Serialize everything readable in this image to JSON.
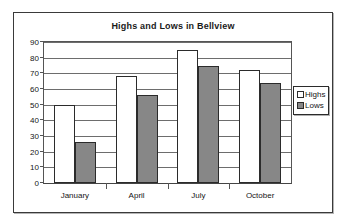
{
  "chart_data": {
    "type": "bar",
    "title": "Highs and Lows in Bellview",
    "xlabel": "",
    "ylabel": "",
    "categories": [
      "January",
      "April",
      "July",
      "October"
    ],
    "series": [
      {
        "name": "Highs",
        "values": [
          50,
          68,
          85,
          72
        ],
        "color": "#ffffff"
      },
      {
        "name": "Lows",
        "values": [
          26,
          56,
          75,
          64
        ],
        "color": "#878787"
      }
    ],
    "ylim": [
      0,
      90
    ],
    "ytick_step": 10,
    "yticks": [
      90,
      80,
      70,
      60,
      50,
      40,
      30,
      20,
      10,
      0
    ],
    "ytick_labels": [
      "90",
      "80",
      "70",
      "60",
      "50",
      "40",
      "30",
      "20",
      "10",
      "0"
    ],
    "grid": true,
    "grid_axis": "y",
    "legend": [
      "Highs",
      "Lows"
    ],
    "legend_position": "right"
  },
  "colors": {
    "highs_fill": "#ffffff",
    "lows_fill": "#878787",
    "bar_outline": "#2b2b2b",
    "gridline": "#6d6d6d",
    "frame": "#3a3a3a",
    "text": "#151515"
  }
}
